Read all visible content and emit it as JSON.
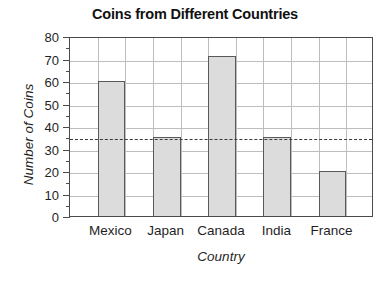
{
  "chart_data": {
    "type": "bar",
    "title": "Coins from Different Countries",
    "xlabel": "Country",
    "ylabel": "Number of Coins",
    "categories": [
      "Mexico",
      "Japan",
      "Canada",
      "India",
      "France"
    ],
    "values": [
      60,
      35,
      71,
      35,
      20
    ],
    "ylim": [
      0,
      80
    ],
    "ytick_labels": [
      "0",
      "10",
      "20",
      "30",
      "40",
      "50",
      "60",
      "70",
      "80"
    ],
    "ytick_values": [
      0,
      10,
      20,
      30,
      40,
      50,
      60,
      70,
      80
    ],
    "yminor_values": [
      5,
      15,
      25,
      35,
      45,
      55,
      65,
      75
    ],
    "grid": "both",
    "legend": "none",
    "annotations": [
      {
        "name": "reference-line",
        "style": "dashed",
        "value": 35,
        "orientation": "horizontal",
        "color": "#3a3a3a"
      }
    ],
    "colors": {
      "bar_fill": "#dcdcdc",
      "bar_edge": "#595959",
      "grid": "#bdbdbd",
      "frame": "#4a4a4a",
      "text": "#1f1f1f",
      "title": "#111111",
      "background": "#ffffff"
    }
  }
}
